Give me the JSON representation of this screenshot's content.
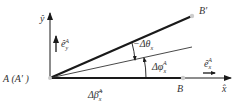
{
  "diagram": {
    "colors": {
      "line": "#1a1a1a",
      "thin_line": "#333333",
      "point": "#cccccc",
      "text": "#333333",
      "background": "#ffffff"
    },
    "labels": {
      "y_axis": "ŷ",
      "x_axis": "x̂",
      "e_y": "ê",
      "e_y_sub": "y",
      "e_y_sup": "A",
      "e_x": "ê",
      "e_x_sub": "x",
      "e_x_sup": "A",
      "origin": "A (A′ )",
      "point_b": "B",
      "point_b_prime": "B′",
      "angle_theta": "−Δθ",
      "angle_theta_sub": "x",
      "angle_phi": "Δφ",
      "angle_phi_sub": "x",
      "angle_phi_sup": "A",
      "delta_beta": "Δβ̂",
      "delta_beta_sub": "x",
      "delta_beta_sup": "A"
    }
  }
}
